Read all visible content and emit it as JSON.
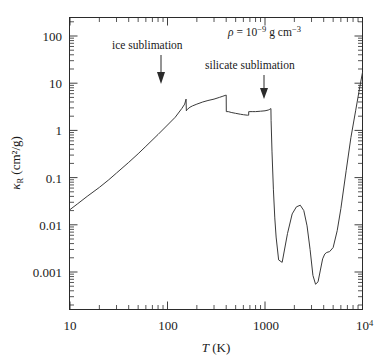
{
  "figure": {
    "name": "rosseland-mean-opacity-plot",
    "xlabel_italic": "T",
    "xlabel_unit": "(K)",
    "ylabel_symbol": "κ",
    "ylabel_sub": "R",
    "ylabel_unit": "(cm²/g)"
  },
  "annotations": {
    "density": {
      "symbol": "ρ",
      "equals": "=",
      "mantissa": "10",
      "exponent": "−9",
      "units": "g cm",
      "units_exponent": "−3",
      "full_text": "ρ = 10⁻⁹ g cm⁻³"
    },
    "ice": {
      "label": "ice sublimation",
      "arrow_temperature": 155
    },
    "silicate": {
      "label": "silicate sublimation",
      "arrow_temperature": 1150
    }
  },
  "axes": {
    "x_ticklabels": [
      "10",
      "100",
      "1000",
      "10"
    ],
    "x_last_exponent": "4",
    "y_ticklabels": [
      "100",
      "10",
      "1",
      "0.1",
      "0.01",
      "0.001"
    ],
    "xlim": [
      10,
      10000
    ],
    "ylim": [
      0.0002,
      300
    ],
    "xscale": "log",
    "yscale": "log",
    "grid": false
  },
  "colors": {
    "curve": "#3a3a3a",
    "frame": "#2b2b2b",
    "text": "#1a1a1a",
    "background": "#ffffff"
  },
  "chart_data": {
    "type": "line",
    "title": "",
    "xlabel": "T (K)",
    "ylabel": "kappa_R (cm^2/g)",
    "xscale": "log",
    "yscale": "log",
    "xlim": [
      10,
      10000
    ],
    "ylim": [
      0.0002,
      300
    ],
    "grid": false,
    "legend": null,
    "annotations": [
      {
        "text": "ρ = 10⁻⁹ g cm⁻³",
        "x": 1000,
        "y": 150
      },
      {
        "text": "ice sublimation",
        "x": 120,
        "y": 60,
        "arrow_to_x": 155,
        "arrow_to_y": 5
      },
      {
        "text": "silicate sublimation",
        "x": 900,
        "y": 22,
        "arrow_to_x": 1150,
        "arrow_to_y": 2.8
      }
    ],
    "series": [
      {
        "name": "Rosseland mean opacity",
        "x": [
          10,
          12,
          15,
          20,
          25,
          30,
          40,
          50,
          60,
          80,
          100,
          120,
          140,
          150,
          155,
          156,
          160,
          170,
          180,
          200,
          230,
          260,
          300,
          340,
          370,
          390,
          400,
          401,
          420,
          450,
          500,
          560,
          600,
          660,
          680,
          681,
          700,
          750,
          800,
          900,
          1000,
          1080,
          1120,
          1150,
          1155,
          1180,
          1220,
          1260,
          1300,
          1380,
          1500,
          1700,
          1900,
          2100,
          2300,
          2500,
          2700,
          2900,
          3100,
          3300,
          3500,
          3700,
          3900,
          4100,
          4300,
          4600,
          5000,
          5500,
          6000,
          6800,
          7600,
          8500,
          9300,
          10000
        ],
        "y": [
          0.021,
          0.028,
          0.04,
          0.062,
          0.09,
          0.125,
          0.21,
          0.32,
          0.46,
          0.82,
          1.3,
          1.9,
          2.9,
          3.6,
          4.6,
          2.6,
          2.8,
          3.1,
          3.3,
          3.6,
          4.0,
          4.3,
          4.6,
          5.0,
          5.3,
          5.5,
          5.6,
          2.5,
          2.5,
          2.4,
          2.3,
          2.2,
          2.15,
          2.1,
          2.1,
          2.5,
          2.5,
          2.5,
          2.5,
          2.55,
          2.6,
          2.7,
          2.8,
          2.9,
          1.6,
          0.35,
          0.055,
          0.014,
          0.0055,
          0.0018,
          0.0016,
          0.0065,
          0.017,
          0.024,
          0.026,
          0.02,
          0.0095,
          0.003,
          0.00085,
          0.00055,
          0.00062,
          0.0011,
          0.0019,
          0.0024,
          0.0026,
          0.0027,
          0.0033,
          0.0075,
          0.022,
          0.14,
          0.7,
          2.6,
          7.5,
          17.0
        ]
      }
    ]
  }
}
